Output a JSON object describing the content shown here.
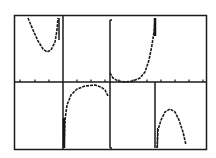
{
  "window": {
    "frame": {
      "x": 14,
      "y": 15,
      "width": 193,
      "height": 135
    }
  },
  "chart_data": {
    "type": "line",
    "title": "",
    "xlabel": "",
    "ylabel": "",
    "grid": false,
    "axes": {
      "x_axis_pixel_y": 82,
      "y_axis_pixel_x": 63
    },
    "x_ticks_px": [
      20,
      35,
      49,
      77,
      91,
      105,
      119,
      133,
      147,
      161,
      175,
      189,
      203
    ],
    "asymptotes_px": [
      60,
      108,
      156
    ],
    "series": [
      {
        "name": "branch-1-up",
        "points": [
          [
            28,
            18
          ],
          [
            33,
            30
          ],
          [
            38,
            41
          ],
          [
            43,
            49
          ],
          [
            47,
            52
          ],
          [
            51,
            50
          ],
          [
            55,
            42
          ],
          [
            57,
            30
          ],
          [
            58,
            18
          ]
        ]
      },
      {
        "name": "branch-2-down",
        "points": [
          [
            64,
            148
          ],
          [
            65,
            120
          ],
          [
            67,
            105
          ],
          [
            71,
            95
          ],
          [
            77,
            89
          ],
          [
            85,
            86
          ],
          [
            95,
            85
          ],
          [
            101,
            87
          ],
          [
            105,
            90
          ],
          [
            108,
            96
          ]
        ]
      },
      {
        "name": "branch-3-up",
        "points": [
          [
            110,
            73
          ],
          [
            113,
            78
          ],
          [
            118,
            81
          ],
          [
            125,
            82
          ],
          [
            133,
            81
          ],
          [
            140,
            78
          ],
          [
            145,
            72
          ],
          [
            149,
            60
          ],
          [
            152,
            45
          ],
          [
            154,
            32
          ],
          [
            155,
            20
          ]
        ]
      },
      {
        "name": "branch-4-down",
        "points": [
          [
            157,
            148
          ],
          [
            158,
            130
          ],
          [
            161,
            120
          ],
          [
            165,
            112
          ],
          [
            170,
            109
          ],
          [
            175,
            112
          ],
          [
            179,
            120
          ],
          [
            183,
            132
          ],
          [
            186,
            145
          ]
        ]
      }
    ]
  }
}
